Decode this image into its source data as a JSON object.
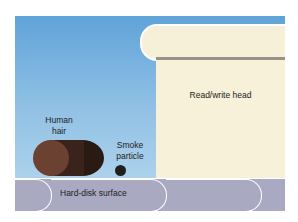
{
  "diagram": {
    "labels": {
      "head": "Read/write head",
      "hair": "Human\nhair",
      "hair_line1": "Human",
      "hair_line2": "hair",
      "smoke_line1": "Smoke",
      "smoke_line2": "particle",
      "disk": "Hard-disk surface"
    },
    "colors": {
      "sky_top": "#5fa3d8",
      "sky_bottom": "#b9d9ee",
      "head": "#f7f1d9",
      "head_stripe": "#9a9189",
      "hair": "#6b4232",
      "smoke": "#1f1f1f",
      "disk": "#a9a9c2"
    }
  }
}
